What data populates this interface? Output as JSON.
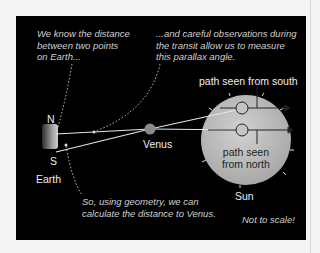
{
  "diagram": {
    "annotations": {
      "earth_distance": [
        "We know the distance",
        "between two points",
        "on Earth..."
      ],
      "parallax": [
        "...and careful observations during",
        "the transit allow us to measure",
        "this parallax angle."
      ],
      "geometry": [
        "So, using geometry, we can",
        "calculate the distance to Venus."
      ],
      "scale_note": "Not to scale!"
    },
    "labels": {
      "north": "N",
      "south": "S",
      "earth": "Earth",
      "venus": "Venus",
      "sun": "Sun",
      "path_south": "path seen from south",
      "path_north_1": "path seen",
      "path_north_2": "from north"
    },
    "colors": {
      "background": "#000000",
      "sun": "#b8b8b8",
      "venus": "#8a8a8a",
      "text": "#dddddd"
    }
  }
}
